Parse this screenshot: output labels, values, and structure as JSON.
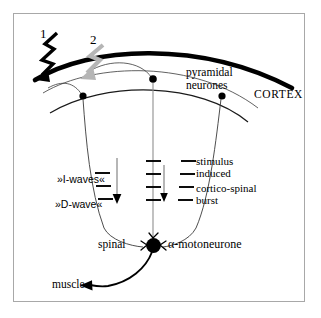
{
  "figure": {
    "frame_color": "#a8a8a8",
    "background": "#ffffff"
  },
  "annotations": {
    "stimulus_1": {
      "number": "1",
      "icon": "lightning-bolt-icon",
      "color": "#000000",
      "description": "black zigzag stimulus arrow onto cortex surface"
    },
    "stimulus_2": {
      "number": "2",
      "icon": "lightning-bolt-icon",
      "color": "#b3b3b3",
      "description": "grey zigzag stimulus arrow onto pyramidal neurone"
    }
  },
  "labels": {
    "pyramidal_line1": "pyramidal",
    "pyramidal_line2": "neurones",
    "cortex": "CORTEX",
    "stimulus_line1": "stimulus",
    "stimulus_line2": "induced",
    "cortico_line1": "cortico-spinal",
    "cortico_line2": "burst",
    "i_waves": "»I-waves«",
    "d_wave": "»D-wave«",
    "spinal": "spinal",
    "alpha_motoneurone": "α-motoneurone",
    "muscle": "muscle"
  },
  "elements": {
    "pyramidal_neurones_count": 3,
    "axons": [
      {
        "name": "left-axon",
        "ticks": 3,
        "has_arrow": true
      },
      {
        "name": "middle-axon",
        "ticks": 4,
        "has_arrow": true
      },
      {
        "name": "right-axon",
        "ticks": 4,
        "has_arrow": false
      }
    ],
    "soma": {
      "name": "alpha-motoneurone-soma",
      "shape": "filled-circle",
      "color": "#000000"
    },
    "synapses": 3,
    "cortex_surface_color": "#000000"
  }
}
